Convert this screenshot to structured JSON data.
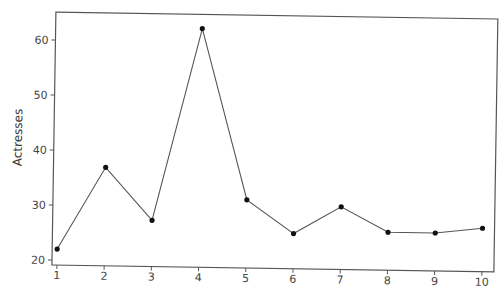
{
  "chart_data": {
    "type": "line",
    "title": "",
    "xlabel": "",
    "ylabel": "Actresses",
    "x": [
      1,
      2,
      3,
      4,
      5,
      6,
      7,
      8,
      9,
      10
    ],
    "series": [
      {
        "name": "Actresses",
        "values": [
          22,
          37,
          27.5,
          62.5,
          31.5,
          25.5,
          30.5,
          26,
          26,
          27
        ]
      }
    ],
    "xlim": [
      0.9,
      10.1
    ],
    "ylim": [
      19,
      65
    ],
    "x_ticks": [
      1,
      2,
      3,
      4,
      5,
      6,
      7,
      8,
      9,
      10
    ],
    "y_ticks": [
      20,
      30,
      40,
      50,
      60
    ],
    "grid": false,
    "legend": null,
    "marker": "filled-circle",
    "line_color": "#555555",
    "marker_color": "#111111"
  }
}
